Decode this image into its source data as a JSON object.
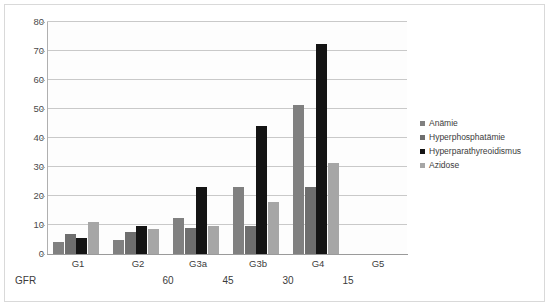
{
  "chart_data": {
    "type": "bar",
    "title": "",
    "subtitle": "",
    "xlabel": "GFR",
    "ylabel": "",
    "categories": [
      "G1",
      "G2",
      "G3a",
      "G3b",
      "G4",
      "G5"
    ],
    "ylim": [
      0,
      80
    ],
    "yticks": [
      0,
      10,
      20,
      30,
      40,
      50,
      60,
      70,
      80
    ],
    "grid": true,
    "legend_position": "right",
    "series": [
      {
        "name": "Anämie",
        "color": "#808080",
        "values": [
          4,
          5,
          12.5,
          23,
          51.5,
          null
        ]
      },
      {
        "name": "Hyperphosphatämie",
        "color": "#6e6e6e",
        "values": [
          7,
          7.5,
          9,
          9.5,
          23,
          null
        ]
      },
      {
        "name": "Hyperparathyreoidismus",
        "color": "#141414",
        "values": [
          5.5,
          9.5,
          23,
          44,
          72.5,
          null
        ]
      },
      {
        "name": "Azidose",
        "color": "#a6a6a6",
        "values": [
          11,
          8.5,
          9.5,
          18,
          31.5,
          null
        ]
      }
    ],
    "secondary_axis": {
      "label": "GFR",
      "values": [
        "60",
        "45",
        "30",
        "15"
      ]
    }
  },
  "axis": {
    "y_tick_labels": [
      "80",
      "70",
      "60",
      "50",
      "40",
      "30",
      "20",
      "10",
      "0"
    ],
    "x_tick_labels": [
      "G1",
      "G2",
      "G3a",
      "G3b",
      "G4",
      "G5"
    ],
    "gfr_title": "GFR",
    "gfr_values": [
      "60",
      "45",
      "30",
      "15"
    ]
  },
  "legend": {
    "items": [
      {
        "label": "Anämie",
        "color": "#808080"
      },
      {
        "label": "Hyperphosphatämie",
        "color": "#6e6e6e"
      },
      {
        "label": "Hyperparathyreoidismus",
        "color": "#141414"
      },
      {
        "label": "Azidose",
        "color": "#a6a6a6"
      }
    ]
  },
  "style": {
    "plot_background": "#fdfdfd",
    "grid_color": "#c9c9c9",
    "axis_color": "#9a9a9a",
    "frame_color": "#d9d9d9",
    "text_color": "#3b3b3b"
  }
}
